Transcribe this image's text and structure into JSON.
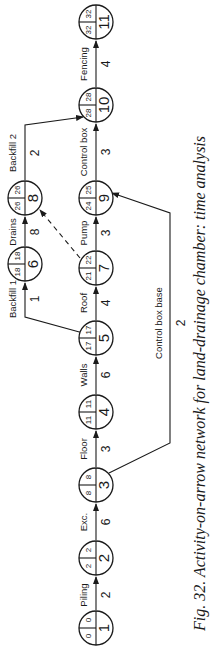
{
  "caption": "Fig. 32. Activity-on-arrow network for land-drainage chamber: time analysis",
  "colors": {
    "ink": "#1a1a1a",
    "background": "#ffffff"
  },
  "nodes": [
    {
      "id": "1",
      "earliest": "0",
      "latest": "0"
    },
    {
      "id": "2",
      "earliest": "2",
      "latest": "2"
    },
    {
      "id": "3",
      "earliest": "8",
      "latest": "8"
    },
    {
      "id": "4",
      "earliest": "11",
      "latest": "11"
    },
    {
      "id": "5",
      "earliest": "17",
      "latest": "17"
    },
    {
      "id": "6",
      "earliest": "18",
      "latest": "18"
    },
    {
      "id": "7",
      "earliest": "21",
      "latest": "22"
    },
    {
      "id": "8",
      "earliest": "26",
      "latest": "26"
    },
    {
      "id": "9",
      "earliest": "24",
      "latest": "25"
    },
    {
      "id": "10",
      "earliest": "28",
      "latest": "28"
    },
    {
      "id": "11",
      "earliest": "32",
      "latest": "32"
    }
  ],
  "activities": [
    {
      "label": "Piling",
      "duration": "2",
      "from": "1",
      "to": "2"
    },
    {
      "label": "Exc.",
      "duration": "6",
      "from": "2",
      "to": "3"
    },
    {
      "label": "Floor",
      "duration": "3",
      "from": "3",
      "to": "4"
    },
    {
      "label": "Walls",
      "duration": "6",
      "from": "4",
      "to": "5"
    },
    {
      "label": "Roof",
      "duration": "4",
      "from": "5",
      "to": "7"
    },
    {
      "label": "Pump",
      "duration": "3",
      "from": "7",
      "to": "9"
    },
    {
      "label": "Control box",
      "duration": "3",
      "from": "9",
      "to": "10"
    },
    {
      "label": "Fencing",
      "duration": "4",
      "from": "10",
      "to": "11"
    },
    {
      "label": "Backfill 1",
      "duration": "1",
      "from": "5",
      "to": "6"
    },
    {
      "label": "Drains",
      "duration": "8",
      "from": "6",
      "to": "8"
    },
    {
      "label": "Backfill 2",
      "duration": "2",
      "from": "8",
      "to": "10"
    },
    {
      "label": "Control box base",
      "duration": "2",
      "from": "3",
      "to": "9"
    },
    {
      "label": "",
      "duration": "",
      "from": "7",
      "to": "8",
      "type": "dummy"
    }
  ]
}
